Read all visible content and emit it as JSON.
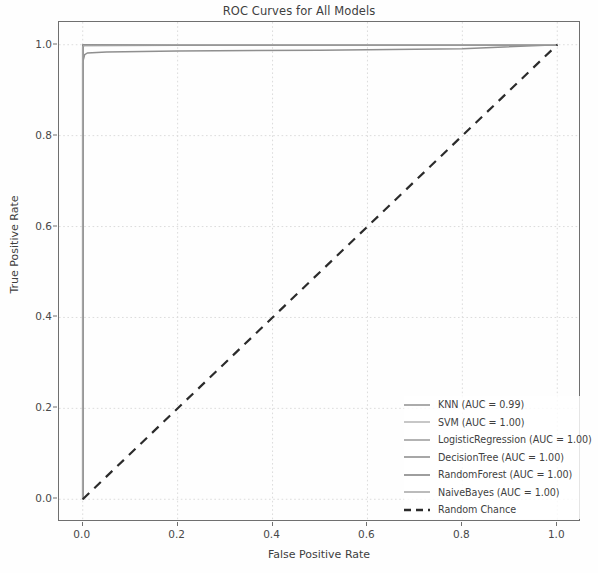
{
  "chart_data": {
    "type": "line",
    "title": "ROC Curves for All Models",
    "xlabel": "False Positive Rate",
    "ylabel": "True Positive Rate",
    "xlim": [
      -0.05,
      1.05
    ],
    "ylim": [
      -0.05,
      1.05
    ],
    "xticks": [
      "0.0",
      "0.2",
      "0.4",
      "0.6",
      "0.8",
      "1.0"
    ],
    "xtick_values": [
      0.0,
      0.2,
      0.4,
      0.6,
      0.8,
      1.0
    ],
    "yticks": [
      "0.0",
      "0.2",
      "0.4",
      "0.6",
      "0.8",
      "1.0"
    ],
    "ytick_values": [
      0.0,
      0.2,
      0.4,
      0.6,
      0.8,
      1.0
    ],
    "grid": true,
    "legend_position": "lower right",
    "series": [
      {
        "name": "KNN",
        "auc": "0.99",
        "legend_label": "KNN (AUC = 0.99)",
        "color": "#8f8f8f",
        "style": "solid",
        "x": [
          0.0,
          0.0,
          0.004,
          0.01,
          0.05,
          0.2,
          0.5,
          0.8,
          1.0
        ],
        "y": [
          0.0,
          0.962,
          0.978,
          0.982,
          0.984,
          0.986,
          0.988,
          0.991,
          1.0
        ]
      },
      {
        "name": "SVM",
        "auc": "1.00",
        "legend_label": "SVM (AUC = 1.00)",
        "color": "#b4b4b4",
        "style": "solid",
        "x": [
          0.0,
          0.0,
          0.003,
          0.2,
          0.6,
          1.0
        ],
        "y": [
          0.0,
          0.993,
          0.998,
          0.999,
          1.0,
          1.0
        ]
      },
      {
        "name": "LogisticRegression",
        "auc": "1.00",
        "legend_label": "LogisticRegression (AUC = 1.00)",
        "color": "#9a9a9a",
        "style": "solid",
        "x": [
          0.0,
          0.0,
          0.002,
          0.2,
          0.6,
          1.0
        ],
        "y": [
          0.0,
          0.996,
          1.0,
          1.0,
          1.0,
          1.0
        ]
      },
      {
        "name": "DecisionTree",
        "auc": "1.00",
        "legend_label": "DecisionTree (AUC = 1.00)",
        "color": "#8a8a8a",
        "style": "solid",
        "x": [
          0.0,
          0.0,
          0.002,
          0.2,
          0.6,
          1.0
        ],
        "y": [
          0.0,
          0.997,
          1.0,
          1.0,
          1.0,
          1.0
        ]
      },
      {
        "name": "RandomForest",
        "auc": "1.00",
        "legend_label": "RandomForest (AUC = 1.00)",
        "color": "#7e7e7e",
        "style": "solid",
        "x": [
          0.0,
          0.0,
          0.001,
          0.2,
          0.6,
          1.0
        ],
        "y": [
          0.0,
          0.999,
          1.0,
          1.0,
          1.0,
          1.0
        ]
      },
      {
        "name": "NaiveBayes",
        "auc": "1.00",
        "legend_label": "NaiveBayes (AUC = 1.00)",
        "color": "#a4a4a4",
        "style": "solid",
        "x": [
          0.0,
          0.0,
          0.002,
          0.2,
          0.6,
          1.0
        ],
        "y": [
          0.0,
          0.995,
          0.999,
          1.0,
          1.0,
          1.0
        ]
      },
      {
        "name": "Random Chance",
        "legend_label": "Random Chance",
        "color": "#2b2b2b",
        "style": "dashed",
        "x": [
          0.0,
          1.0
        ],
        "y": [
          0.0,
          1.0
        ]
      }
    ]
  },
  "legend": {
    "items": [
      {
        "label": "KNN (AUC = 0.99)"
      },
      {
        "label": "SVM (AUC = 1.00)"
      },
      {
        "label": "LogisticRegression (AUC = 1.00)"
      },
      {
        "label": "DecisionTree (AUC = 1.00)"
      },
      {
        "label": "RandomForest (AUC = 1.00)"
      },
      {
        "label": "NaiveBayes (AUC = 1.00)"
      },
      {
        "label": "Random Chance"
      }
    ]
  }
}
